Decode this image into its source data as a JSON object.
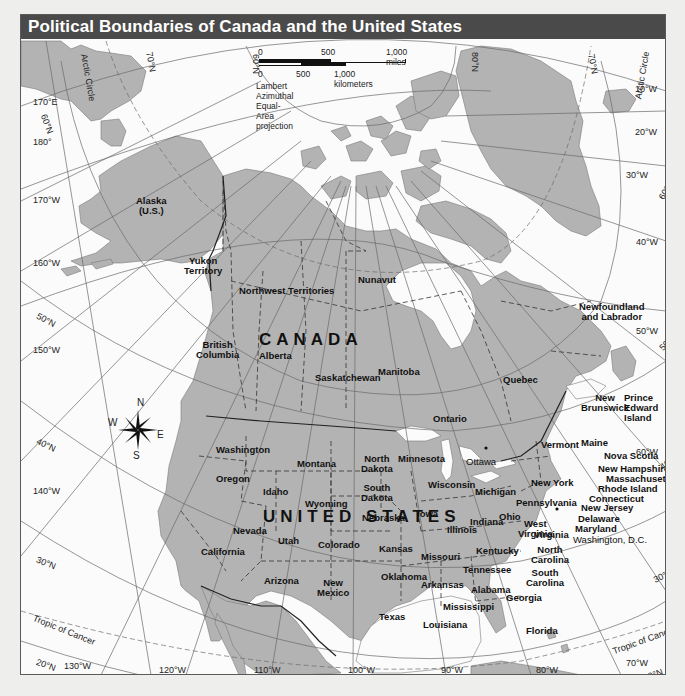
{
  "title": "Political Boundaries of Canada and the United States",
  "scale": {
    "miles_labels": [
      "0",
      "500",
      "1,000 miles"
    ],
    "km_labels": [
      "0",
      "500",
      "1,000 kilometers"
    ],
    "projection": "Lambert Azimuthal Equal-Area projection"
  },
  "compass": {
    "n": "N",
    "s": "S",
    "e": "E",
    "w": "W"
  },
  "countries": {
    "canada": "CANADA",
    "usa": "UNITED STATES",
    "alaska": "Alaska",
    "alaska_note": "(U.S.)"
  },
  "canada_regions": {
    "yukon": "Yukon",
    "yukon2": "Territory",
    "nwt": "Northwest Territories",
    "nunavut": "Nunavut",
    "bc": "British",
    "bc2": "Columbia",
    "alberta": "Alberta",
    "saskatchewan": "Saskatchewan",
    "manitoba": "Manitoba",
    "ontario": "Ontario",
    "quebec": "Quebec",
    "nl": "Newfoundland",
    "nl2": "and Labrador",
    "nb": "New",
    "nb2": "Brunswick",
    "pei": "Prince",
    "pei2": "Edward",
    "pei3": "Island",
    "ns": "Nova Scotia",
    "ottawa": "Ottawa"
  },
  "us_states": {
    "washington": "Washington",
    "oregon": "Oregon",
    "california": "California",
    "idaho": "Idaho",
    "nevada": "Nevada",
    "montana": "Montana",
    "wyoming": "Wyoming",
    "utah": "Utah",
    "colorado": "Colorado",
    "arizona": "Arizona",
    "new_mexico": "New",
    "new_mexico2": "Mexico",
    "north_dakota": "North",
    "north_dakota2": "Dakota",
    "south_dakota": "South",
    "south_dakota2": "Dakota",
    "nebraska": "Nebraska",
    "kansas": "Kansas",
    "oklahoma": "Oklahoma",
    "texas": "Texas",
    "minnesota": "Minnesota",
    "iowa": "Iowa",
    "missouri": "Missouri",
    "arkansas": "Arkansas",
    "louisiana": "Louisiana",
    "wisconsin": "Wisconsin",
    "illinois": "Illinois",
    "michigan": "Michigan",
    "indiana": "Indiana",
    "ohio": "Ohio",
    "kentucky": "Kentucky",
    "tennessee": "Tennessee",
    "mississippi": "Mississippi",
    "alabama": "Alabama",
    "georgia": "Georgia",
    "florida": "Florida",
    "south_carolina": "South",
    "south_carolina2": "Carolina",
    "north_carolina": "North",
    "north_carolina2": "Carolina",
    "virginia": "Virginia",
    "west_virginia": "West",
    "west_virginia2": "Virginia",
    "pennsylvania": "Pennsylvania",
    "new_york": "New York",
    "vermont": "Vermont",
    "maine": "Maine",
    "new_hampshire": "New Hampshire",
    "massachusetts": "Massachusetts",
    "rhode_island": "Rhode Island",
    "connecticut": "Connecticut",
    "new_jersey": "New Jersey",
    "delaware": "Delaware",
    "maryland": "Maryland",
    "dc": "Washington, D.C."
  },
  "grid_labels": {
    "lat_70n": "70°N",
    "lat_60n_top": "60°N",
    "lat_60n_left": "60°N",
    "lat_60n_right": "60°N",
    "lat_50n_left": "50°N",
    "lat_50n_right": "50°N",
    "lat_40n_left": "40°N",
    "lat_40n_right": "40°N",
    "lat_30n_left": "30°N",
    "lat_30n_right": "30°N",
    "lat_20n_left": "20°N",
    "lat_20n_right": "20°N",
    "lat_80n": "80°N",
    "lat_70n_right": "70°N",
    "lon_170e": "170°E",
    "lon_180": "180°",
    "lon_170w": "170°W",
    "lon_160w": "160°W",
    "lon_150w": "150°W",
    "lon_140w": "140°W",
    "lon_130w": "130°W",
    "lon_120w": "120°W",
    "lon_110w": "110°W",
    "lon_100w": "100°W",
    "lon_90w": "90°W",
    "lon_80w": "80°W",
    "lon_70w": "70°W",
    "lon_60w": "60°W",
    "lon_50w": "50°W",
    "lon_40w": "40°W",
    "lon_30w": "30°W",
    "lon_20w": "20°W",
    "lon_10w": "10°W",
    "arctic_circle_left": "Arctic Circle",
    "arctic_circle_right": "Arctic Circle",
    "tropic_left": "Tropic of Cancer",
    "tropic_right": "Tropic of Cancer"
  },
  "colors": {
    "land": "#b3b3b3",
    "water": "#fbfbfb",
    "title_bar": "#4a4a4a",
    "title_text": "#ffffff",
    "border": "#222222"
  }
}
